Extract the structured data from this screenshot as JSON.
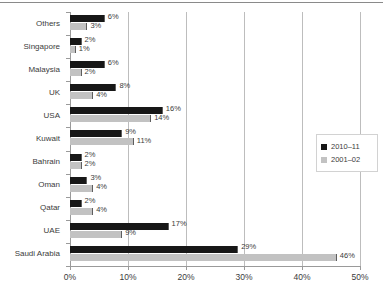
{
  "top_rule": true,
  "chart_data": {
    "type": "bar",
    "orientation": "horizontal",
    "title": "",
    "subtitle": "",
    "xlabel": "",
    "ylabel": "",
    "xlim": [
      0,
      50
    ],
    "xticks": [
      "0%",
      "10%",
      "20%",
      "30%",
      "40%",
      "50%"
    ],
    "xtick_values": [
      0,
      10,
      20,
      30,
      40,
      50
    ],
    "grid": true,
    "grid_axis": "x",
    "legend_position": "right",
    "categories": [
      "Others",
      "Singapore",
      "Malaysia",
      "UK",
      "USA",
      "Kuwait",
      "Bahrain",
      "Oman",
      "Qatar",
      "UAE",
      "Saudi Arabia"
    ],
    "series": [
      {
        "name": "2010–11",
        "color": "#171717",
        "values": [
          6,
          2,
          6,
          8,
          16,
          9,
          2,
          3,
          2,
          17,
          29
        ],
        "labels": [
          "6%",
          "2%",
          "6%",
          "8%",
          "16%",
          "9%",
          "2%",
          "3%",
          "2%",
          "17%",
          "29%"
        ]
      },
      {
        "name": "2001–02",
        "color": "#c2c2c2",
        "values": [
          3,
          1,
          2,
          4,
          14,
          11,
          2,
          4,
          4,
          9,
          46
        ],
        "labels": [
          "3%",
          "1%",
          "2%",
          "4%",
          "14%",
          "11%",
          "2%",
          "4%",
          "4%",
          "9%",
          "46%"
        ]
      }
    ]
  },
  "legend": {
    "items": [
      {
        "label": "2010–11",
        "color": "#171717"
      },
      {
        "label": "2001–02",
        "color": "#c2c2c2"
      }
    ]
  },
  "colors": {
    "series_dark": "#171717",
    "series_light": "#c2c2c2",
    "gridline": "#bdbdbd",
    "axis": "#9a9a9a",
    "text": "#3b3b3b",
    "background": "#ffffff"
  }
}
